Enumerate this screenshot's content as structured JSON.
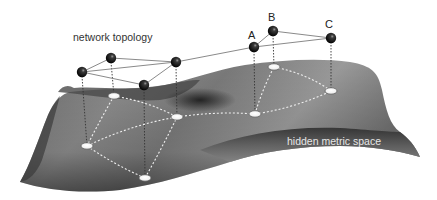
{
  "labels": {
    "network_topology": "network topology",
    "hidden_metric_space": "hidden metric space",
    "node_a": "A",
    "node_b": "B",
    "node_c": "C"
  },
  "colors": {
    "background": "#ffffff",
    "surface_dark": "#2e2e2e",
    "surface_mid": "#7a7a7a",
    "surface_light": "#a8a8a8",
    "topology_edge": "#8a8a8a",
    "sphere": "#111111",
    "disk": "#ffffff",
    "text_dark": "#333333",
    "text_light": "#e6e6e6"
  },
  "network_nodes": [
    {
      "id": "n1",
      "x": 82,
      "y": 72
    },
    {
      "id": "n2",
      "x": 111,
      "y": 58
    },
    {
      "id": "n3",
      "x": 144,
      "y": 85
    },
    {
      "id": "n4",
      "x": 176,
      "y": 62
    },
    {
      "id": "A",
      "x": 254,
      "y": 47
    },
    {
      "id": "B",
      "x": 273,
      "y": 31
    },
    {
      "id": "C",
      "x": 331,
      "y": 38
    }
  ],
  "metric_nodes": [
    {
      "id": "n1",
      "x": 87,
      "y": 146
    },
    {
      "id": "n2",
      "x": 114,
      "y": 96
    },
    {
      "id": "n3",
      "x": 145,
      "y": 178
    },
    {
      "id": "n4",
      "x": 177,
      "y": 117
    },
    {
      "id": "A",
      "x": 255,
      "y": 114
    },
    {
      "id": "B",
      "x": 274,
      "y": 67
    },
    {
      "id": "C",
      "x": 331,
      "y": 91
    }
  ],
  "edges": [
    [
      "n1",
      "n2"
    ],
    [
      "n1",
      "n4"
    ],
    [
      "n1",
      "n3"
    ],
    [
      "n2",
      "n4"
    ],
    [
      "n3",
      "n4"
    ],
    [
      "n4",
      "A"
    ],
    [
      "A",
      "B"
    ],
    [
      "A",
      "C"
    ],
    [
      "B",
      "C"
    ]
  ]
}
